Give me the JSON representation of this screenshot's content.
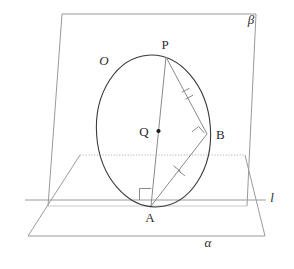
{
  "figure": {
    "width": 294,
    "height": 269,
    "background_color": "#ffffff"
  },
  "labels": {
    "plane_beta": "β",
    "plane_alpha": "α",
    "line_l": "l",
    "circle_O": "O",
    "center_Q": "Q",
    "point_P": "P",
    "point_A": "A",
    "point_B": "B"
  },
  "colors": {
    "plane_edge": "#9a9a9a",
    "plane_edge_dotted": "#b4b4b4",
    "circle_stroke": "#3a3a3a",
    "chord_stroke": "#8a8a8a",
    "tick_stroke": "#8a8a8a",
    "right_angle_stroke": "#8a8a8a",
    "label_text": "#2b2b2b",
    "point_dot": "#1a1a1a",
    "line_l_stroke": "#9a9a9a"
  },
  "geometry": {
    "plane_beta": {
      "name": "beta",
      "points": "62,14 256,14 247,206 48,206"
    },
    "plane_alpha": {
      "name": "alpha",
      "points": "80,155 245,155 265,236 28,236",
      "solid_edges": [
        "245,155 265,236",
        "265,236 28,236",
        "28,236 80,155"
      ],
      "dotted_edge": "80,155 245,155"
    },
    "line_l": {
      "x1": 25,
      "y1": 200,
      "x2": 266,
      "y2": 200
    },
    "circle": {
      "cx": 153.5,
      "cy": 131,
      "rx": 57,
      "ry": 76,
      "rotation": -4
    },
    "points": {
      "P": {
        "x": 166,
        "y": 57,
        "label_x": 164,
        "label_y": 49
      },
      "A": {
        "x": 151,
        "y": 206,
        "label_x": 148,
        "label_y": 221
      },
      "B": {
        "x": 207,
        "y": 134,
        "label_x": 215,
        "label_y": 138
      },
      "Q": {
        "x": 158.5,
        "y": 131,
        "label_x": 138,
        "label_y": 135,
        "dot_r": 2
      },
      "O_label": {
        "x": 104,
        "y": 65
      }
    },
    "segments": [
      {
        "name": "PA",
        "x1": 166,
        "y1": 57,
        "x2": 151,
        "y2": 206
      },
      {
        "name": "PB",
        "x1": 166,
        "y1": 57,
        "x2": 207,
        "y2": 134
      },
      {
        "name": "AB",
        "x1": 151,
        "y1": 206,
        "x2": 207,
        "y2": 134
      }
    ],
    "tick_marks": [
      {
        "name": "tick-PB",
        "cx": 187.5,
        "cy": 96,
        "count": 2
      },
      {
        "name": "tick-AB",
        "cx": 179,
        "cy": 170,
        "count": 2
      }
    ],
    "right_angles": [
      {
        "name": "right-angle-A",
        "type": "square-axis",
        "x": 139,
        "y": 193,
        "size": 12
      },
      {
        "name": "right-angle-B",
        "type": "square-rotated",
        "cx": 199,
        "cy": 134,
        "size": 10
      }
    ]
  }
}
